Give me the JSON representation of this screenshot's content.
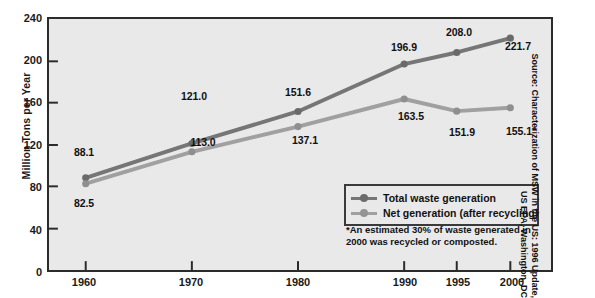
{
  "chart_data": {
    "type": "line",
    "title": "",
    "xlabel": "",
    "ylabel": "Million Tons per Year",
    "categories": [
      "1960",
      "1970",
      "1980",
      "1990",
      "1995",
      "2000"
    ],
    "x_positions": [
      1960,
      1970,
      1980,
      1990,
      1995,
      2000
    ],
    "ylim": [
      0,
      240
    ],
    "yticks": [
      0,
      40,
      80,
      120,
      160,
      200,
      240
    ],
    "grid": false,
    "legend_position": "inside-bottom-right",
    "series": [
      {
        "name": "Total waste generation",
        "color": "#767676",
        "values": [
          88.1,
          121.0,
          151.6,
          196.9,
          208.0,
          221.7
        ],
        "labels": [
          "88.1",
          "121.0",
          "151.6",
          "196.9",
          "208.0",
          "221.7"
        ]
      },
      {
        "name": "Net generation (after recycling)",
        "color": "#a0a0a0",
        "values": [
          82.5,
          113.0,
          137.1,
          163.5,
          151.9,
          155.1
        ],
        "labels": [
          "82.5",
          "113.0",
          "137.1",
          "163.5",
          "151.9",
          "155.1*"
        ]
      }
    ],
    "annotations": [
      "*An estimated 30% of waste generated in 2000 was recycled or composted."
    ]
  },
  "axes": {
    "y_title": "Million Tons per Year",
    "y_tick_labels": [
      "240",
      "200",
      "160",
      "120",
      "80",
      "40",
      "0"
    ],
    "x_tick_labels": [
      "1960",
      "1970",
      "1980",
      "1990",
      "1995",
      "2000"
    ]
  },
  "legend": {
    "items": [
      {
        "label": "Total waste generation",
        "color": "#767676"
      },
      {
        "label": "Net generation (after recycling)",
        "color": "#a0a0a0"
      }
    ]
  },
  "footnote": {
    "line1": "*An estimated 30% of waste generated in",
    "line2": "2000 was recycled or composted."
  },
  "source": {
    "line1": "Source: Characterization of MSW in the US: 1996 Update,",
    "line2": "US EPA, Washington, DC"
  },
  "colors": {
    "total_series": "#767676",
    "net_series": "#a0a0a0",
    "plot_background": "#e9e9e9",
    "frame": "#2b2b2b",
    "text": "#111111"
  },
  "data_labels": [
    {
      "text": "88.1",
      "x": 84,
      "y": 152
    },
    {
      "text": "82.5",
      "x": 84,
      "y": 203
    },
    {
      "text": "121.0",
      "x": 194,
      "y": 96
    },
    {
      "text": "113.0",
      "x": 203,
      "y": 142
    },
    {
      "text": "151.6",
      "x": 298,
      "y": 92
    },
    {
      "text": "137.1",
      "x": 305,
      "y": 140
    },
    {
      "text": "196.9",
      "x": 404,
      "y": 47
    },
    {
      "text": "163.5",
      "x": 411,
      "y": 116
    },
    {
      "text": "208.0",
      "x": 459,
      "y": 32
    },
    {
      "text": "151.9",
      "x": 462,
      "y": 132
    },
    {
      "text": "221.7",
      "x": 518,
      "y": 46
    },
    {
      "text": "155.1*",
      "x": 521,
      "y": 131
    }
  ]
}
